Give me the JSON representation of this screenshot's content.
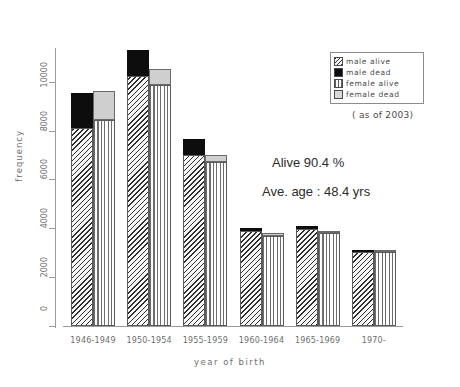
{
  "chart_data": {
    "type": "bar",
    "title": "",
    "xlabel": "year of birth",
    "ylabel": "frequency",
    "ylim": [
      0,
      11500
    ],
    "yticks": [
      0,
      2000,
      4000,
      6000,
      8000,
      10000
    ],
    "ytick_labels": [
      "0",
      "2000",
      "4000",
      "6000",
      "8000",
      "10000"
    ],
    "grid": false,
    "stacked": true,
    "grouped": true,
    "legend_position": "top-right",
    "categories": [
      "1946-1949",
      "1950-1954",
      "1955-1959",
      "1960-1964",
      "1965-1969",
      "1970-"
    ],
    "series": [
      {
        "name": "male alive",
        "group": "male",
        "values": [
          8100,
          10250,
          7000,
          3870,
          3950,
          3030
        ]
      },
      {
        "name": "male dead",
        "group": "male",
        "values": [
          1450,
          1050,
          640,
          160,
          140,
          20
        ]
      },
      {
        "name": "female alive",
        "group": "female",
        "values": [
          8450,
          9850,
          6700,
          3700,
          3800,
          3020
        ]
      },
      {
        "name": "female dead",
        "group": "female",
        "values": [
          1150,
          650,
          300,
          90,
          80,
          10
        ]
      }
    ],
    "bar_totals": {
      "male": [
        9550,
        11300,
        7640,
        4030,
        4090,
        3050
      ],
      "female": [
        9600,
        10500,
        7000,
        3790,
        3880,
        3030
      ]
    },
    "annotations": [
      "Alive 90.4 %",
      "Ave. age : 48.4 yrs",
      "( as of 2003)"
    ]
  },
  "legend": {
    "items": [
      {
        "label": "male alive",
        "pattern": "diagonal-hatch"
      },
      {
        "label": "male dead",
        "pattern": "solid-black"
      },
      {
        "label": "female alive",
        "pattern": "vertical-lines"
      },
      {
        "label": "female dead",
        "pattern": "light-gray"
      }
    ],
    "note": "( as of 2003)"
  },
  "annotations": {
    "alive_rate": "Alive 90.4 %",
    "average_age": "Ave. age : 48.4 yrs"
  },
  "colors": {
    "male_dead": "#0d0d0d",
    "female_dead": "#cfcfcf",
    "hatch_stroke": "#2e2e2e",
    "axis": "#9a9a9a",
    "text": "#6e6e6e"
  }
}
